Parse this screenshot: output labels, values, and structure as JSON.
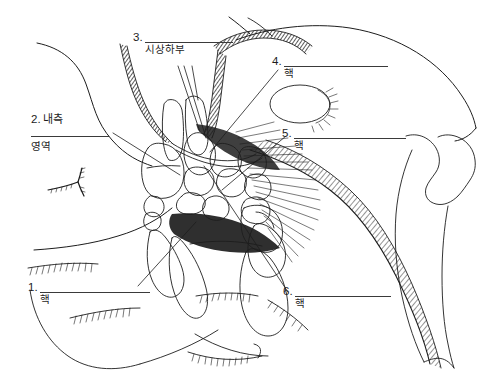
{
  "figure": {
    "title": "",
    "type": "anatomical-line-drawing",
    "background_color": "#ffffff",
    "ink_color": "#1d1d1d",
    "width": 483,
    "height": 388
  },
  "labels": [
    {
      "id": "label-1",
      "number": "1.",
      "prefix": "",
      "blank": "",
      "suffix": "핵",
      "leader_from": [
        138,
        286
      ],
      "leader_to": [
        196,
        222
      ]
    },
    {
      "id": "label-2",
      "number": "2.",
      "prefix": "내측",
      "blank": "",
      "suffix": "영역",
      "leader_from": [
        113,
        133
      ],
      "leader_to": [
        180,
        175
      ]
    },
    {
      "id": "label-3",
      "number": "3.",
      "prefix": "",
      "blank": "",
      "suffix": "시상하부",
      "leader_from": [
        178,
        66
      ],
      "leader_to": [
        205,
        138
      ]
    },
    {
      "id": "label-4",
      "number": "4.",
      "prefix": "",
      "blank": "",
      "suffix": "핵",
      "leader_from": [
        278,
        70
      ],
      "leader_to": [
        214,
        152
      ]
    },
    {
      "id": "label-5",
      "number": "5.",
      "prefix": "",
      "blank": "",
      "suffix": "핵",
      "leader_from": [
        286,
        136
      ],
      "leader_to": [
        224,
        189
      ]
    },
    {
      "id": "label-6",
      "number": "6.",
      "prefix": "",
      "blank": "",
      "suffix": "핵",
      "leader_from": [
        288,
        292
      ],
      "leader_to": [
        205,
        168
      ]
    }
  ],
  "colors": {
    "ink": "#1d1d1d",
    "rule": "#3a3a3a",
    "paper": "#ffffff",
    "shade": "#2b2b2b"
  }
}
